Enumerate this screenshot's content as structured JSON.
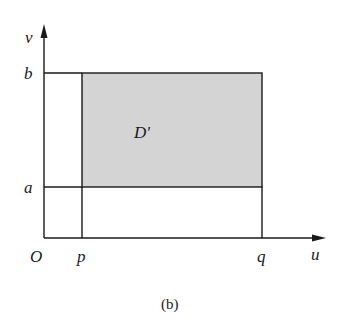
{
  "figure": {
    "caption": "(b)",
    "region_label": "D'",
    "axes": {
      "x_label": "u",
      "y_label": "v",
      "origin_label": "O"
    },
    "x_ticks": [
      "p",
      "q"
    ],
    "y_ticks": [
      "a",
      "b"
    ],
    "colors": {
      "region_fill": "#d4d4d4",
      "line": "#1a1a1a",
      "background": "#ffffff"
    }
  }
}
